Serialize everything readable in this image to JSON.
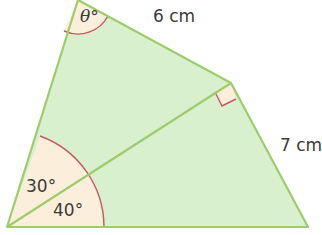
{
  "diagram": {
    "type": "geometry-quadrilateral",
    "colors": {
      "fill": "#d9f0cf",
      "stroke": "#9ccd6a",
      "angle_fill": "#fbefdc",
      "angle_arc": "#c9585a",
      "text": "#3a3a3a"
    },
    "vertices": {
      "top": [
        78,
        0
      ],
      "bottom_left": [
        7,
        227
      ],
      "right": [
        231,
        83
      ],
      "bottom_right": [
        308,
        227
      ]
    },
    "labels": {
      "theta": "θ°",
      "side_top": "6 cm",
      "side_right": "7 cm",
      "angle_upper": "30°",
      "angle_lower": "40°"
    },
    "markers": {
      "right_angle": "right angle at diagonal/right vertex"
    }
  }
}
